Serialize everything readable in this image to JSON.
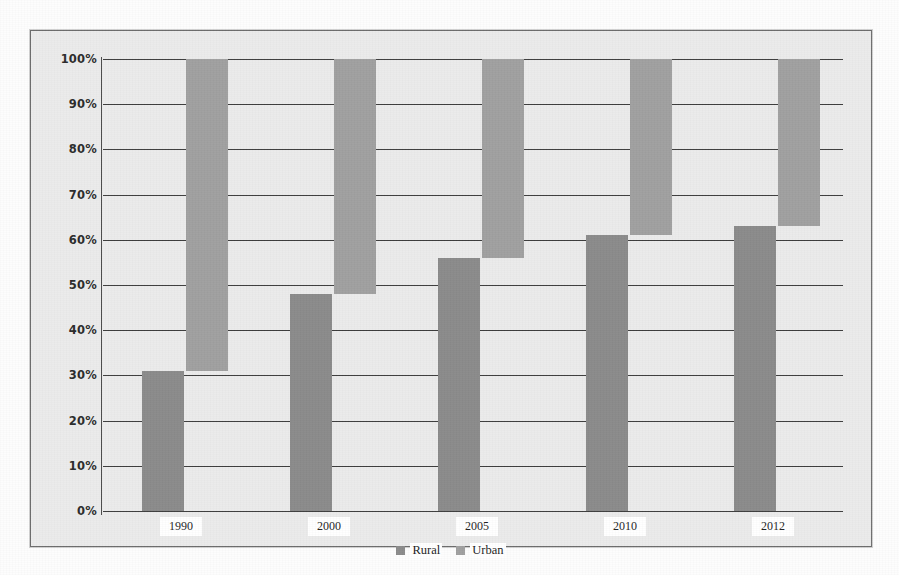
{
  "chart_data": {
    "type": "bar",
    "title": "",
    "subtitle": "",
    "xlabel": "",
    "ylabel": "",
    "categories": [
      "1990",
      "2000",
      "2005",
      "2010",
      "2012"
    ],
    "series": [
      {
        "name": "Rural",
        "values": [
          31,
          48,
          56,
          61,
          63
        ],
        "color": "#8b8b8b"
      },
      {
        "name": "Urban",
        "values": [
          69,
          52,
          44,
          39,
          37
        ],
        "color": "#a0a0a0"
      }
    ],
    "stacked_to_100": true,
    "urban_segment_start": [
      31,
      48,
      56,
      61,
      63
    ],
    "urban_segment_end": [
      100,
      100,
      100,
      100,
      100
    ],
    "ylim": [
      0,
      100
    ],
    "ytick_values": [
      0,
      10,
      20,
      30,
      40,
      50,
      60,
      70,
      80,
      90,
      100
    ],
    "ytick_labels": [
      "0%",
      "10%",
      "20%",
      "30%",
      "40%",
      "50%",
      "60%",
      "70%",
      "80%",
      "90%",
      "100%"
    ],
    "grid": true,
    "grid_axis": "y",
    "legend_position": "bottom",
    "legend_entries": [
      "Rural",
      "Urban"
    ],
    "annotations": [],
    "value_unit": "%"
  },
  "legend": {
    "items": [
      {
        "label": "Rural",
        "color": "#8b8b8b",
        "swatch_name": "legend-swatch-rural"
      },
      {
        "label": "Urban",
        "color": "#a0a0a0",
        "swatch_name": "legend-swatch-urban"
      }
    ]
  },
  "axis": {
    "y_labels": [
      "100%",
      "90%",
      "80%",
      "70%",
      "60%",
      "50%",
      "40%",
      "30%",
      "20%",
      "10%",
      "0%"
    ],
    "x_labels": [
      "1990",
      "2000",
      "2005",
      "2010",
      "2012"
    ]
  },
  "colors": {
    "plot_background": "#ebebeb",
    "frame_border": "#6d6d6d",
    "gridline": "#3d3d3d",
    "rural": "#8b8b8b",
    "urban": "#a0a0a0",
    "tick_text": "#2b2b2b"
  }
}
